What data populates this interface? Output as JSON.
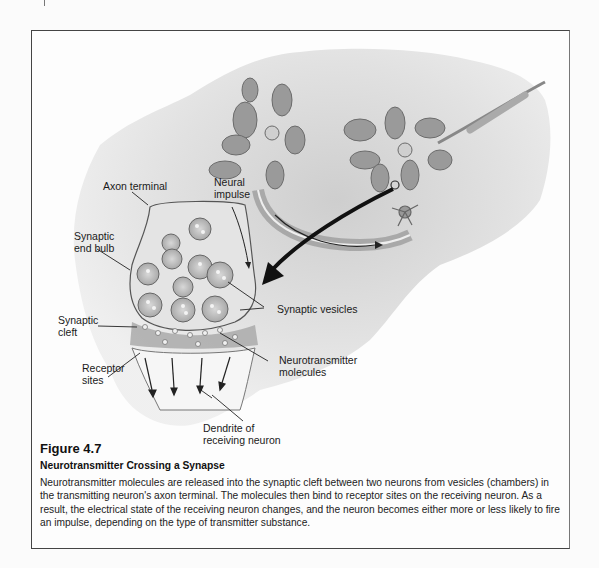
{
  "figure": {
    "number": "Figure 4.7",
    "title": "Neurotransmitter Crossing a Synapse",
    "caption": "Neurotransmitter molecules are released into the synaptic cleft between two neurons from vesicles (chambers) in the transmitting neuron's axon terminal. The molecules then bind to receptor sites on the receiving neuron. As a result, the electrical state of the receiving neuron changes, and the neuron becomes either more or less likely to fire an impulse, depending on the type of transmitter substance."
  },
  "labels": {
    "axon_terminal": "Axon terminal",
    "neural_impulse_1": "Neural",
    "neural_impulse_2": "impulse",
    "synaptic_end_bulb_1": "Synaptic",
    "synaptic_end_bulb_2": "end bulb",
    "synaptic_vesicles": "Synaptic vesicles",
    "synaptic_cleft_1": "Synaptic",
    "synaptic_cleft_2": "cleft",
    "neurotransmitter_molecules_1": "Neurotransmitter",
    "neurotransmitter_molecules_2": "molecules",
    "receptor_sites_1": "Receptor",
    "receptor_sites_2": "sites",
    "dendrite_1": "Dendrite of",
    "dendrite_2": "receiving neuron"
  }
}
